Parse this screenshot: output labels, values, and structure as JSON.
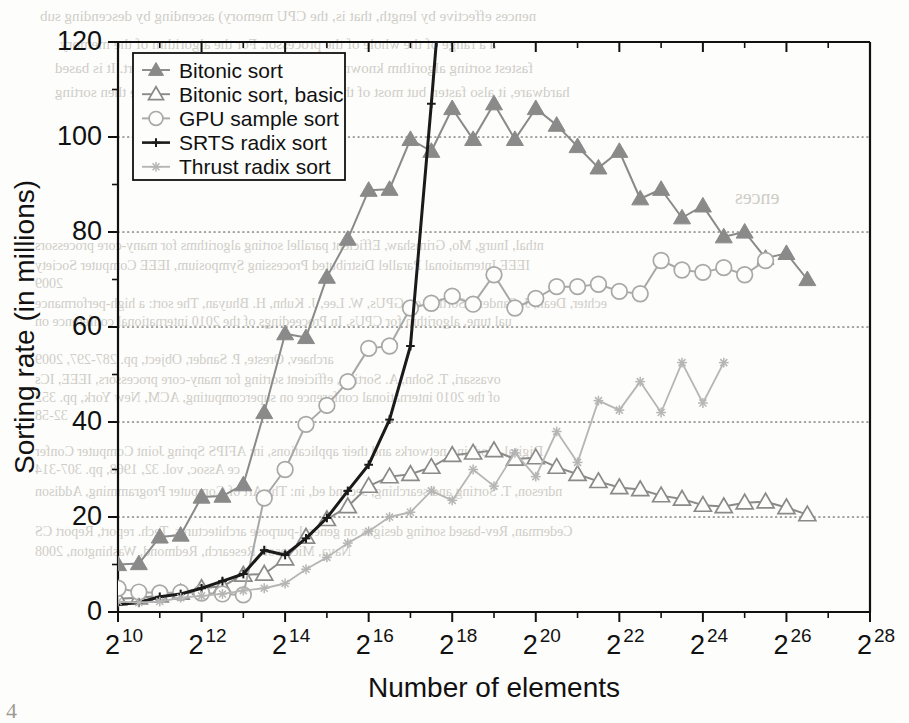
{
  "chart_data": {
    "type": "line",
    "title": "",
    "xlabel": "Number of elements",
    "ylabel": "Sorting rate (in millions)",
    "xlim": [
      10,
      28
    ],
    "ylim": [
      0,
      120
    ],
    "x_tick_labels": [
      "2^10",
      "2^12",
      "2^14",
      "2^16",
      "2^18",
      "2^20",
      "2^22",
      "2^24",
      "2^26",
      "2^28"
    ],
    "x_tick_exponents": [
      10,
      12,
      14,
      16,
      18,
      20,
      22,
      24,
      26,
      28
    ],
    "x_minor_exponents": [
      11,
      13,
      15,
      17,
      19,
      21,
      23,
      25,
      27
    ],
    "y_tick_labels": [
      "0",
      "20",
      "40",
      "60",
      "80",
      "100",
      "120"
    ],
    "y_tick_values": [
      0,
      20,
      40,
      60,
      80,
      100,
      120
    ],
    "y_minor_values": [
      10,
      30,
      50,
      70,
      90,
      110
    ],
    "grid": "horizontal-dotted-major",
    "legend_position": "top-left",
    "x_axis_note": "log2 scale, x value is the exponent",
    "series": [
      {
        "name": "Bitonic sort",
        "color": "#8a8a8a",
        "marker": "triangle-filled",
        "x": [
          10.0,
          10.5,
          11.0,
          11.5,
          12.0,
          12.5,
          13.0,
          13.5,
          14.0,
          14.5,
          15.0,
          15.5,
          16.0,
          16.5,
          17.0,
          17.5,
          18.0,
          18.5,
          19.0,
          19.5,
          20.0,
          20.5,
          21.0,
          21.5,
          22.0,
          22.5,
          23.0,
          23.5,
          24.0,
          24.5,
          25.0,
          25.5,
          26.0,
          26.5
        ],
        "y": [
          10.0,
          10.2,
          15.8,
          16.2,
          24.2,
          24.4,
          26.8,
          42.0,
          58.6,
          57.8,
          70.5,
          78.5,
          88.8,
          89.0,
          99.5,
          97.0,
          106.0,
          99.5,
          107.0,
          99.5,
          106.0,
          102.5,
          98.0,
          93.5,
          97.0,
          87.0,
          89.0,
          83.0,
          85.5,
          79.0,
          80.0,
          74.5,
          75.5,
          70.0
        ]
      },
      {
        "name": "Bitonic sort, basic",
        "color": "#8a8a8a",
        "marker": "triangle-open",
        "x": [
          10.0,
          10.5,
          11.0,
          11.5,
          12.0,
          12.5,
          13.0,
          13.5,
          14.0,
          14.5,
          15.0,
          15.5,
          16.0,
          16.5,
          17.0,
          17.5,
          18.0,
          18.5,
          19.0,
          19.5,
          20.0,
          20.5,
          21.0,
          21.5,
          22.0,
          22.5,
          23.0,
          23.5,
          24.0,
          24.5,
          25.0,
          25.5,
          26.0,
          26.5
        ],
        "y": [
          2.8,
          3.0,
          3.4,
          4.0,
          5.0,
          5.4,
          7.8,
          8.0,
          11.2,
          15.8,
          19.5,
          22.2,
          26.5,
          28.5,
          29.0,
          30.5,
          33.0,
          33.5,
          34.0,
          32.2,
          32.5,
          30.5,
          29.0,
          27.5,
          26.2,
          25.8,
          24.5,
          23.8,
          22.5,
          22.2,
          23.0,
          23.2,
          22.0,
          20.5
        ]
      },
      {
        "name": "GPU sample sort",
        "color": "#a8a8a8",
        "marker": "circle-open",
        "x": [
          10.0,
          10.5,
          11.0,
          11.5,
          12.0,
          12.5,
          13.0,
          13.5,
          14.0,
          14.5,
          15.0,
          15.5,
          16.0,
          16.5,
          17.0,
          17.5,
          18.0,
          18.5,
          19.0,
          19.5,
          20.0,
          20.5,
          21.0,
          21.5,
          22.0,
          22.5,
          23.0,
          23.5,
          24.0,
          24.5,
          25.0,
          25.5
        ],
        "y": [
          5.0,
          4.2,
          4.0,
          4.1,
          4.0,
          3.8,
          3.6,
          24.0,
          30.0,
          39.5,
          43.5,
          48.5,
          55.5,
          56.0,
          64.0,
          65.0,
          66.5,
          64.8,
          71.0,
          64.0,
          66.0,
          68.5,
          68.5,
          69.0,
          67.5,
          67.0,
          74.0,
          72.0,
          71.5,
          72.5,
          71.0,
          74.0
        ]
      },
      {
        "name": "SRTS radix sort",
        "color": "#1a1a1a",
        "marker": "plus",
        "x": [
          10.0,
          10.5,
          11.0,
          11.5,
          12.0,
          12.5,
          13.0,
          13.5,
          14.0,
          14.5,
          15.0,
          15.5,
          16.0,
          16.5,
          17.0,
          17.5,
          17.62
        ],
        "y": [
          1.6,
          2.0,
          3.2,
          3.8,
          5.0,
          6.5,
          8.0,
          13.0,
          12.0,
          15.5,
          19.8,
          25.5,
          31.0,
          40.5,
          56.0,
          107.0,
          120.0
        ]
      },
      {
        "name": "Thrust radix sort",
        "color": "#b6b6b6",
        "marker": "star",
        "x": [
          10.0,
          10.5,
          11.0,
          11.5,
          12.0,
          12.5,
          13.0,
          13.5,
          14.0,
          14.5,
          15.0,
          15.5,
          16.0,
          16.5,
          17.0,
          17.5,
          18.0,
          18.5,
          19.0,
          19.5,
          20.0,
          20.5,
          21.0,
          21.5,
          22.0,
          22.5,
          23.0,
          23.5,
          24.0,
          24.5
        ],
        "y": [
          2.2,
          2.0,
          2.2,
          3.0,
          3.4,
          3.8,
          4.5,
          5.0,
          6.0,
          9.0,
          11.5,
          14.5,
          17.0,
          20.0,
          21.0,
          25.5,
          23.5,
          30.0,
          26.5,
          33.5,
          28.5,
          38.0,
          31.5,
          44.5,
          42.5,
          48.5,
          42.0,
          52.5,
          44.0,
          52.5
        ]
      }
    ]
  },
  "legend": {
    "entries": [
      {
        "label": "Bitonic sort"
      },
      {
        "label": "Bitonic sort, basic"
      },
      {
        "label": "GPU sample sort"
      },
      {
        "label": "SRTS radix sort"
      },
      {
        "label": "Thrust radix sort"
      }
    ]
  },
  "background_bleed": [
    {
      "text": "nences effective by length, that is, the CPU memory) ascending by descending sub",
      "x": 40,
      "y": 8,
      "size": 15
    },
    {
      "text": "a a range of the whole of the processor. For the algorithm of the memory",
      "x": 60,
      "y": 36,
      "size": 15
    },
    {
      "text": "fastest sorting algorithm known to the authors that is not a radix sort. It is based",
      "x": 55,
      "y": 60,
      "size": 15
    },
    {
      "text": "hardware, it also faster, but most of the data compared with those that are then sorting",
      "x": 55,
      "y": 84,
      "size": 15
    },
    {
      "text": "ences",
      "x": 735,
      "y": 186,
      "size": 20
    },
    {
      "text": "nthal, Inurg, Mo, Grimshaw, Efficient parallel sorting algorithms for many-core processors",
      "x": 35,
      "y": 238,
      "size": 14
    },
    {
      "text": "IEEE International Parallel Distributed Processing Symposium, IEEE Computer Society",
      "x": 35,
      "y": 258,
      "size": 14
    },
    {
      "text": "2009",
      "x": 35,
      "y": 276,
      "size": 14
    },
    {
      "text": "echter, Dean, J. Sanders, Sorting on GPUs, W. Lee, J. Kuhn, H. Bhuyan, The sort: a high-performance",
      "x": 35,
      "y": 296,
      "size": 14
    },
    {
      "text": "ual tune, algorithm for CPUs, In Proceedings of the 2010 international conference on",
      "x": 35,
      "y": 314,
      "size": 14
    },
    {
      "text": "archaev, Oreste, P. Sander, Object, pp. 287-297, 2009",
      "x": 35,
      "y": 352,
      "size": 14
    },
    {
      "text": "ovassari, T. Sohn, A. Sorting, efficient sorting for many-core processors, IEEE, ICs",
      "x": 35,
      "y": 372,
      "size": 14
    },
    {
      "text": "of the 2010 international conference on supercomputing, ACM, New York, pp. 352",
      "x": 35,
      "y": 390,
      "size": 14
    },
    {
      "text": "32-58",
      "x": 35,
      "y": 408,
      "size": 14
    },
    {
      "text": "Digital, Codeing networks and their applications, in: AFIPS Spring Joint Computer Confer",
      "x": 35,
      "y": 444,
      "size": 14
    },
    {
      "text": "ce Assoc, vol. 32, 1968, pp. 307-314",
      "x": 35,
      "y": 462,
      "size": 14
    },
    {
      "text": "ndreson, T. Sorting and searching, second ed, in: The Art of Computer Programming, Addison",
      "x": 35,
      "y": 484,
      "size": 14
    },
    {
      "text": "Cederman, Rev-based sorting designs on general-purpose architectures, Tech. report, Report CS",
      "x": 35,
      "y": 524,
      "size": 14
    },
    {
      "text": "Nava, Microsoft Research, Redmond, Washington, 2008",
      "x": 35,
      "y": 544,
      "size": 14
    }
  ],
  "figure_caption": "4"
}
